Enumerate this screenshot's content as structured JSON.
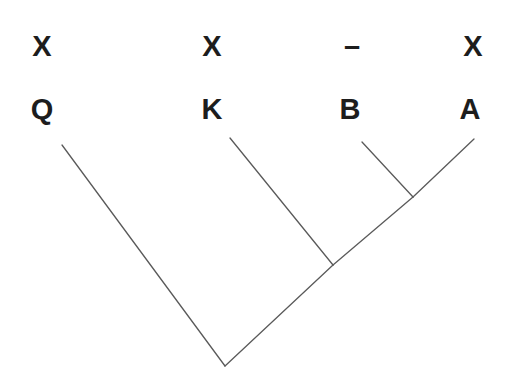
{
  "diagram": {
    "type": "cladogram",
    "background_color": "#ffffff",
    "line_color": "#5a5a5a",
    "text_color": "#1d1d1d",
    "character_states": [
      {
        "label": "X",
        "x": 42
      },
      {
        "label": "X",
        "x": 212
      },
      {
        "label": "–",
        "x": 352
      },
      {
        "label": "X",
        "x": 473
      }
    ],
    "taxa": [
      {
        "label": "Q",
        "x": 42
      },
      {
        "label": "K",
        "x": 212
      },
      {
        "label": "B",
        "x": 350
      },
      {
        "label": "A",
        "x": 470
      }
    ],
    "tips": [
      {
        "name": "Q",
        "x": 62,
        "y": 145
      },
      {
        "name": "K",
        "x": 230,
        "y": 138
      },
      {
        "name": "B",
        "x": 362,
        "y": 142
      },
      {
        "name": "A",
        "x": 474,
        "y": 139
      }
    ],
    "nodes": [
      {
        "name": "node-ba",
        "x": 413,
        "y": 197
      },
      {
        "name": "node-bak",
        "x": 333,
        "y": 265
      },
      {
        "name": "root",
        "x": 225,
        "y": 366
      }
    ],
    "branches": [
      {
        "name": "branch-q",
        "x1": 62,
        "y1": 145,
        "x2": 225,
        "y2": 366
      },
      {
        "name": "branch-k",
        "x1": 230,
        "y1": 138,
        "x2": 333,
        "y2": 265
      },
      {
        "name": "branch-b",
        "x1": 362,
        "y1": 142,
        "x2": 413,
        "y2": 197
      },
      {
        "name": "branch-a",
        "x1": 474,
        "y1": 139,
        "x2": 413,
        "y2": 197
      },
      {
        "name": "branch-ba-to-bak",
        "x1": 413,
        "y1": 197,
        "x2": 333,
        "y2": 265
      },
      {
        "name": "branch-bak-to-root",
        "x1": 333,
        "y1": 265,
        "x2": 225,
        "y2": 366
      }
    ]
  }
}
